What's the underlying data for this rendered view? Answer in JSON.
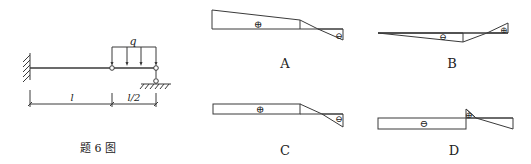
{
  "figure": {
    "caption": "题 6 图",
    "load_label": "q",
    "dim_left": "l",
    "dim_right": "l/2"
  },
  "options": [
    {
      "label": "A",
      "signs": [
        "⊕",
        "⊖"
      ]
    },
    {
      "label": "B",
      "signs": [
        "⊖",
        "⊕"
      ]
    },
    {
      "label": "C",
      "signs": [
        "⊕",
        "⊖"
      ]
    },
    {
      "label": "D",
      "signs": [
        "⊖",
        "⊕"
      ]
    }
  ],
  "colors": {
    "line": "#3a3a3a",
    "background": "#ffffff"
  }
}
